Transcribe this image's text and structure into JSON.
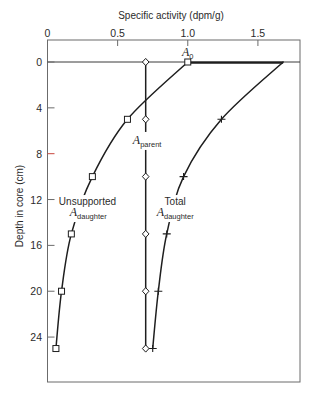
{
  "chart_data": {
    "type": "line",
    "title": "Specific activity (dpm/g)",
    "xlabel": "Specific activity (dpm/g)",
    "ylabel": "Depth in core (cm)",
    "x_axis_position": "top",
    "y_axis_inverted": true,
    "xlim": [
      0,
      1.8
    ],
    "ylim": [
      -1.92,
      27.92
    ],
    "x_ticks": [
      0,
      0.5,
      1.0,
      1.5
    ],
    "x_tick_labels": [
      "0",
      "0.5",
      "1.0",
      "1.5"
    ],
    "y_ticks": [
      0,
      4,
      8,
      12,
      16,
      20,
      24
    ],
    "y_tick_labels": [
      "0",
      "4",
      "8",
      "12",
      "16",
      "20",
      "24"
    ],
    "grid": false,
    "legend": "none (inline curve labels)",
    "depth_cm": [
      0,
      5,
      10,
      15,
      20,
      25
    ],
    "series": [
      {
        "name": "A parent",
        "key": "parent",
        "marker": "diamond",
        "style": "straight",
        "values": [
          0.7,
          0.7,
          0.7,
          0.7,
          0.7,
          0.7
        ]
      },
      {
        "name": "Unsupported A daughter",
        "key": "unsupported-daughter",
        "marker": "square",
        "style": "smooth",
        "values": [
          1.0,
          0.57,
          0.32,
          0.17,
          0.1,
          0.06
        ]
      },
      {
        "name": "Total A daughter",
        "key": "total-daughter",
        "marker": "cross",
        "style": "smooth",
        "marker_from_index": 1,
        "surface_segment": [
          1.0,
          1.68
        ],
        "values": [
          1.68,
          1.24,
          0.97,
          0.85,
          0.79,
          0.75
        ]
      }
    ],
    "reference_line": {
      "depth": 0
    },
    "annotations": [
      {
        "name": "a0-label",
        "main": "A",
        "sub": "0",
        "x": 1.0,
        "y": -0.52,
        "bg": false
      },
      {
        "name": "a-parent-label",
        "main": "A",
        "sub": "parent",
        "x": 0.71,
        "y": 7.15,
        "bg": true
      },
      {
        "name": "unsupported-label",
        "text": "Unsupported",
        "x": 0.285,
        "y": 12.48,
        "bg": true
      },
      {
        "name": "unsupported-a-daughter-label",
        "main": "A",
        "sub": "daughter",
        "x": 0.29,
        "y": 13.44,
        "bg": true
      },
      {
        "name": "total-label",
        "text": "Total",
        "x": 0.91,
        "y": 12.48,
        "bg": true
      },
      {
        "name": "total-a-daughter-label",
        "main": "A",
        "sub": "daughter",
        "x": 0.91,
        "y": 13.44,
        "bg": true
      }
    ],
    "tick_mark_colors": {
      "8": "#c8453c"
    }
  },
  "colors": {
    "background": "#ffffff",
    "frame": "#6b6b6b",
    "curve": "#1e1e1e",
    "text": "#2b2b2b",
    "marker_fill": "#ffffff"
  }
}
